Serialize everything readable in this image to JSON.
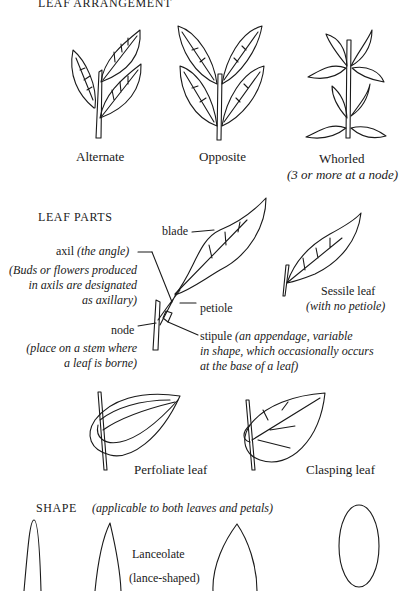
{
  "sections": {
    "arrangement": {
      "heading": "LEAF ARRANGEMENT",
      "items": [
        {
          "label": "Alternate"
        },
        {
          "label": "Opposite"
        },
        {
          "label": "Whorled",
          "note": "(3 or more at a node)"
        }
      ]
    },
    "parts": {
      "heading": "LEAF PARTS",
      "labels": {
        "blade": "blade",
        "axil": "axil",
        "axil_def": "(the angle)",
        "axil_note_1": "(Buds or flowers produced",
        "axil_note_2": "in axils are designated",
        "axil_note_3": "as axillary)",
        "petiole": "petiole",
        "node": "node",
        "node_note_1": "(place on a stem where",
        "node_note_2": "a leaf is borne)",
        "stipule": "stipule",
        "stipule_note_1": "(an appendage, variable",
        "stipule_note_2": "in shape, which occasionally occurs",
        "stipule_note_3": "at the base of a leaf)",
        "sessile": "Sessile leaf",
        "sessile_note": "(with no petiole)"
      }
    },
    "attachment": {
      "items": [
        {
          "label": "Perfoliate leaf"
        },
        {
          "label": "Clasping leaf"
        }
      ]
    },
    "shape": {
      "heading": "SHAPE",
      "subheading": "(applicable to both leaves and petals)",
      "label": "Lanceolate",
      "label_note": "(lance-shaped)"
    }
  }
}
